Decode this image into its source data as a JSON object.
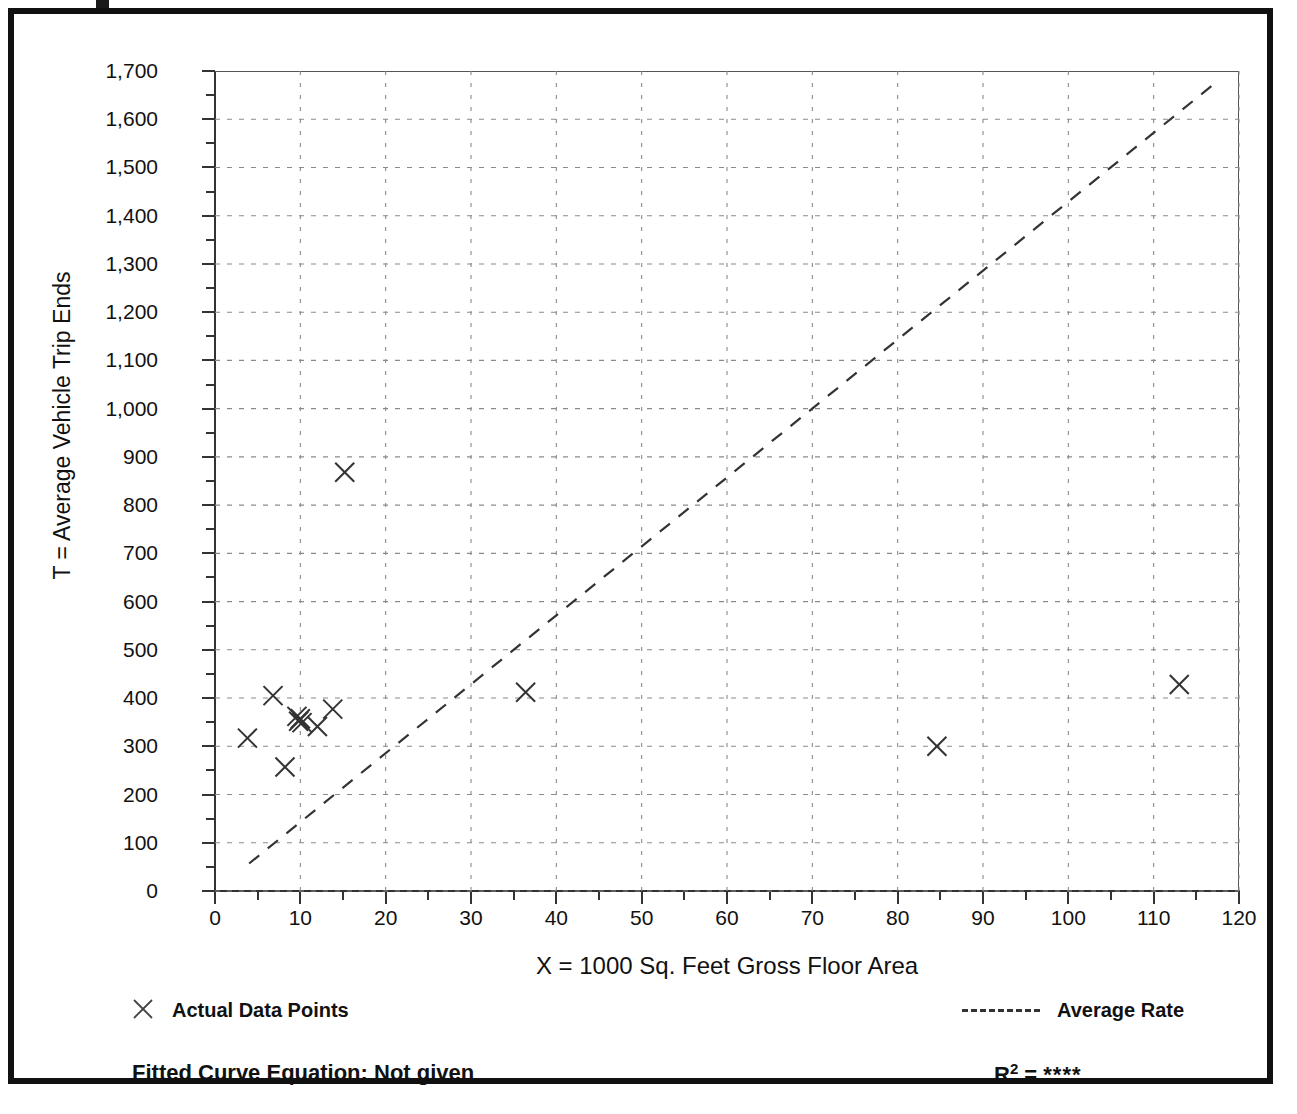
{
  "figure": {
    "frame_color": "#111111",
    "background": "#ffffff"
  },
  "legend": {
    "actual_points_label": "Actual Data Points",
    "average_rate_label": "Average Rate",
    "marker_icon": "x-marker-icon",
    "line_icon": "dashed-line-icon"
  },
  "footer": {
    "fitted_curve_label": "Fitted Curve Equation:  Not given",
    "r_squared_prefix": "R",
    "r_squared_exponent": "2",
    "r_squared_equals": " = ",
    "r_squared_value": "****"
  },
  "chart_data": {
    "type": "scatter",
    "title": "",
    "xlabel": "X = 1000 Sq. Feet Gross Floor Area",
    "ylabel": "T = Average Vehicle Trip Ends",
    "xlim": [
      0,
      120
    ],
    "ylim": [
      0,
      1700
    ],
    "xtick_step": 10,
    "ytick_step": 100,
    "xminor_step": 5,
    "yminor_step": 50,
    "grid": true,
    "grid_style": "dotted",
    "legend_position": "below-plot",
    "xticklabels": [
      "0",
      "10",
      "20",
      "30",
      "40",
      "50",
      "60",
      "70",
      "80",
      "90",
      "100",
      "110",
      "120"
    ],
    "yticklabels": [
      "0",
      "100",
      "200",
      "300",
      "400",
      "500",
      "600",
      "700",
      "800",
      "900",
      "1,000",
      "1,100",
      "1,200",
      "1,300",
      "1,400",
      "1,500",
      "1,600",
      "1,700"
    ],
    "series": [
      {
        "name": "Actual Data Points",
        "marker": "x",
        "color": "#333333",
        "points": [
          {
            "x": 3.8,
            "y": 317
          },
          {
            "x": 6.8,
            "y": 405
          },
          {
            "x": 8.2,
            "y": 257
          },
          {
            "x": 9.6,
            "y": 362
          },
          {
            "x": 9.8,
            "y": 352
          },
          {
            "x": 10.0,
            "y": 357
          },
          {
            "x": 10.2,
            "y": 349
          },
          {
            "x": 12.0,
            "y": 341
          },
          {
            "x": 13.8,
            "y": 377
          },
          {
            "x": 15.2,
            "y": 868
          },
          {
            "x": 36.4,
            "y": 412
          },
          {
            "x": 84.6,
            "y": 300
          },
          {
            "x": 113.0,
            "y": 428
          }
        ]
      },
      {
        "name": "Average Rate",
        "marker": "none",
        "linestyle": "dashed",
        "color": "#333333",
        "endpoints": [
          {
            "x": 4.0,
            "y": 57
          },
          {
            "x": 117.0,
            "y": 1672
          }
        ]
      }
    ]
  }
}
